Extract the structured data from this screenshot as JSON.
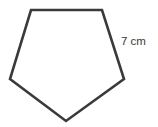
{
  "diagram": {
    "shape": "regular-pentagon",
    "vertices": [
      {
        "x": 31,
        "y": 10
      },
      {
        "x": 102,
        "y": 10
      },
      {
        "x": 124,
        "y": 79
      },
      {
        "x": 66,
        "y": 121
      },
      {
        "x": 10,
        "y": 79
      }
    ],
    "stroke_color": "#3a3a3a",
    "stroke_width": 2.6,
    "fill_color": "#ffffff",
    "side_label": "7 cm"
  }
}
